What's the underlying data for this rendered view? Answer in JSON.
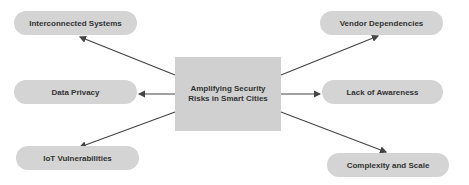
{
  "diagram": {
    "center": {
      "label": "Amplifying Security Risks in Smart Cities"
    },
    "nodes": [
      {
        "id": "interconnected",
        "label": "Interconnected Systems"
      },
      {
        "id": "data-privacy",
        "label": "Data Privacy"
      },
      {
        "id": "iot",
        "label": "IoT Vulnerabilities"
      },
      {
        "id": "vendor",
        "label": "Vendor Dependencies"
      },
      {
        "id": "awareness",
        "label": "Lack of Awareness"
      },
      {
        "id": "complexity",
        "label": "Complexity and Scale"
      }
    ],
    "colors": {
      "node_fill": "#d4d4d4",
      "center_fill": "#d0d0d0",
      "arrow": "#444444",
      "text": "#333333"
    }
  }
}
